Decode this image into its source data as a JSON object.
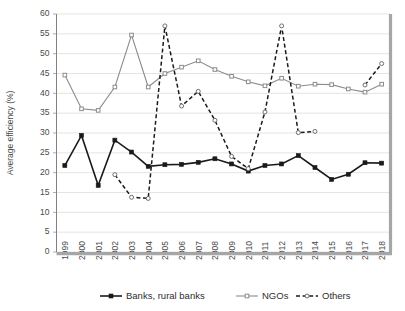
{
  "chart_data": {
    "type": "line",
    "title": "",
    "xlabel": "",
    "ylabel": "Average efficiency (%)",
    "ylim": [
      0,
      60
    ],
    "ytick_step": 5,
    "yticks": [
      0,
      5,
      10,
      15,
      20,
      25,
      30,
      35,
      40,
      45,
      50,
      55,
      60
    ],
    "grid": true,
    "legend_position": "bottom",
    "categories": [
      "1999",
      "2000",
      "2001",
      "2002",
      "2003",
      "2004",
      "2005",
      "2006",
      "2007",
      "2008",
      "2009",
      "2010",
      "2011",
      "2012",
      "2013",
      "2014",
      "2015",
      "2016",
      "2017",
      "2018"
    ],
    "series": [
      {
        "name": "Banks, rural banks",
        "color": "#1a1a1a",
        "style": "solid",
        "marker": "square-filled",
        "values": [
          21.8,
          29.4,
          16.8,
          28.2,
          25.2,
          21.6,
          22.0,
          22.1,
          22.6,
          23.5,
          22.2,
          20.4,
          21.8,
          22.2,
          24.3,
          21.3,
          18.3,
          19.6,
          22.5,
          22.4
        ]
      },
      {
        "name": "NGOs",
        "color": "#8c8c8c",
        "style": "solid",
        "marker": "square-open",
        "values": [
          44.6,
          36.1,
          35.7,
          41.6,
          54.7,
          41.6,
          45.0,
          46.6,
          48.2,
          46.0,
          44.3,
          42.9,
          41.9,
          43.8,
          41.8,
          42.3,
          42.2,
          41.1,
          40.3,
          42.3
        ]
      },
      {
        "name": "Others",
        "color": "#1a1a1a",
        "style": "dashed",
        "marker": "circle-open",
        "values": [
          null,
          null,
          null,
          19.5,
          13.8,
          13.5,
          57.0,
          36.8,
          40.5,
          33.2,
          24.1,
          21.0,
          35.3,
          57.0,
          30.1,
          30.4,
          null,
          null,
          42.1,
          47.5
        ]
      }
    ]
  },
  "legend": {
    "items": [
      {
        "label": "Banks, rural banks"
      },
      {
        "label": "NGOs"
      },
      {
        "label": "Others"
      }
    ]
  }
}
